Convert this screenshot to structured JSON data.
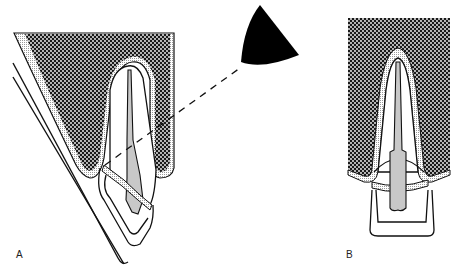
{
  "figure": {
    "panels": [
      {
        "id": "A",
        "label": "A",
        "view": "angled tooth section with overlay"
      },
      {
        "id": "B",
        "label": "B",
        "view": "frontal tooth section"
      }
    ],
    "colors": {
      "line": "#111111",
      "bone_hatch_dark": "#1a1a1a",
      "bone_hatch_light": "#ffffff",
      "pulp_fill": "#c8c8c8",
      "stipple": "#bdbdbd",
      "wedge_fill": "#000000",
      "background": "#ffffff"
    }
  }
}
